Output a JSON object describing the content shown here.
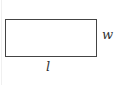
{
  "diagram": {
    "type": "rectangle",
    "labels": {
      "width": "w",
      "length": "l"
    },
    "colors": {
      "stroke": "#444444",
      "text": "#333333",
      "background": "#ffffff"
    }
  }
}
